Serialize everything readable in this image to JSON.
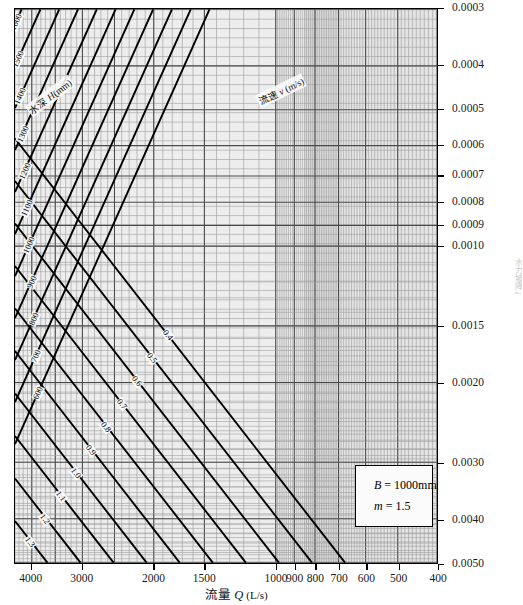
{
  "chart_data": {
    "type": "line",
    "title": "",
    "xlabel": "流量 Q (L/s)",
    "ylabel": "水力坡降 i",
    "x_axis": {
      "scale": "log",
      "reversed": true,
      "min": 400,
      "max": 4400,
      "ticks": [
        4000,
        3000,
        2000,
        1500,
        1000,
        900,
        800,
        700,
        600,
        500,
        400
      ],
      "tick_labels": [
        "4000",
        "3000",
        "2000",
        "1500",
        "1000",
        "900",
        "800",
        "700",
        "600",
        "500",
        "400"
      ]
    },
    "y_axis": {
      "scale": "log",
      "reversed": true,
      "min": 0.0003,
      "max": 0.005,
      "ticks": [
        0.0003,
        0.0004,
        0.0005,
        0.0006,
        0.0007,
        0.0008,
        0.0009,
        0.001,
        0.0015,
        0.002,
        0.003,
        0.004,
        0.005
      ],
      "tick_labels": [
        "0.0003",
        "0.0004",
        "0.0005",
        "0.0006",
        "0.0007",
        "0.0008",
        "0.0009",
        "0.0010",
        "0.0015",
        "0.0020",
        "0.0030",
        "0.0040",
        "0.0050"
      ]
    },
    "grid": true,
    "legend_position": "inside-bottom-right",
    "series": [
      {
        "name": "水深 H(mm)",
        "family": "depth",
        "unit": "mm",
        "labels": [
          "1600",
          "1500",
          "1400",
          "1300",
          "1200",
          "1100",
          "1000",
          "900",
          "800",
          "700",
          "600",
          "500"
        ],
        "values": [
          1600,
          1500,
          1400,
          1300,
          1200,
          1100,
          1000,
          900,
          800,
          700,
          600,
          500
        ]
      },
      {
        "name": "流速 v (m/s)",
        "family": "velocity",
        "unit": "m/s",
        "labels": [
          "0.4",
          "0.5",
          "0.6",
          "0.7",
          "0.8",
          "0.9",
          "1.0",
          "1.1",
          "1.2",
          "1.3",
          "1.4",
          "1.5",
          "1.6",
          "1.7"
        ],
        "values": [
          0.4,
          0.5,
          0.6,
          0.7,
          0.8,
          0.9,
          1.0,
          1.1,
          1.2,
          1.3,
          1.4,
          1.5,
          1.6,
          1.7
        ]
      }
    ],
    "annotations": [
      {
        "text": "B = 1000mm"
      },
      {
        "text": "m = 1.5"
      }
    ]
  },
  "axes": {
    "x_title_cn": "流量",
    "x_title_sym": "Q",
    "x_title_unit": "(L/s)",
    "y_title_side": "水力坡降 i",
    "x_ticks": [
      "4000",
      "3000",
      "2000",
      "1500",
      "1000",
      "900",
      "800",
      "700",
      "600",
      "500",
      "400"
    ],
    "y_ticks": [
      "0.0003",
      "0.0004",
      "0.0005",
      "0.0006",
      "0.0007",
      "0.0008",
      "0.0009",
      "0.0010",
      "0.0015",
      "0.0020",
      "0.0030",
      "0.0040",
      "0.0050"
    ]
  },
  "families": {
    "depth_title_cn": "水深",
    "depth_title_sym": "H",
    "depth_title_unit": "(mm)",
    "velocity_title_cn": "流速",
    "velocity_title_sym": "v",
    "velocity_title_unit": "(m/s)",
    "depth_labels": [
      "1600",
      "1500",
      "1400",
      "1300",
      "1200",
      "1100",
      "1000",
      "900",
      "800",
      "700",
      "600",
      "500"
    ],
    "velocity_labels": [
      "0.4",
      "0.5",
      "0.6",
      "0.7",
      "0.8",
      "0.9",
      "1.0",
      "1.1",
      "1.2",
      "1.3",
      "1.4",
      "1.5",
      "1.6",
      "1.7"
    ]
  },
  "legend": {
    "line1_sym": "B",
    "line1_val": "= 1000mm",
    "line2_sym": "m",
    "line2_val": "= 1.5"
  },
  "colors": {
    "line": "#000000",
    "grid_major": "#555555",
    "grid_minor": "#9a9a9a",
    "background": "#fdfdfd",
    "band_light": "#e9e9e9",
    "band_dark": "#d2d2d2"
  }
}
